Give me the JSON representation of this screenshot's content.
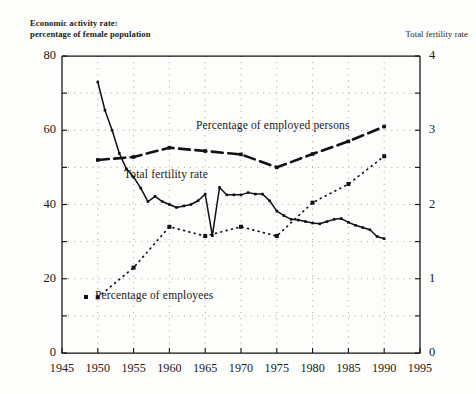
{
  "header": {
    "clipped_top_text": "",
    "left_axis_caption_line1": "Economic activity rate:",
    "left_axis_caption_line2": "percentage of female population",
    "right_axis_caption": "Total fertility rate"
  },
  "annotations": {
    "employed_persons": "Percentage of employed persons",
    "total_fertility_rate": "Total fertility rate",
    "employees": "Percentage of employees"
  },
  "colors": {
    "ink": "#111111",
    "grid": "#8a8a86",
    "paper": "#fdfdfb"
  },
  "chart_data": {
    "type": "line",
    "title": "",
    "xlabel": "",
    "ylabel": "Economic activity rate: percentage of female population",
    "y2label": "Total fertility rate",
    "xlim": [
      1945,
      1995
    ],
    "ylim": [
      0,
      80
    ],
    "y2lim": [
      0,
      4
    ],
    "grid": true,
    "legend": "inline-annotations",
    "xticks": [
      1945,
      1950,
      1955,
      1960,
      1965,
      1970,
      1975,
      1980,
      1985,
      1990,
      1995
    ],
    "xticklabels": [
      "1945",
      "1950",
      "1955",
      "1960",
      "1965",
      "1970",
      "1975",
      "1980",
      "1985",
      "1990",
      "1995"
    ],
    "yticks": [
      0,
      10,
      20,
      30,
      40,
      50,
      60,
      70,
      80
    ],
    "yticklabels": [
      "0",
      "",
      "20",
      "",
      "40",
      "",
      "60",
      "",
      "80"
    ],
    "y2ticks": [
      0,
      0.5,
      1,
      1.5,
      2,
      2.5,
      3,
      3.5,
      4
    ],
    "y2ticklabels": [
      "0",
      "",
      "1",
      "",
      "2",
      "",
      "3",
      "",
      "4"
    ],
    "series": [
      {
        "name": "Total fertility rate",
        "axis": "right",
        "style": "solid-line-with-square-markers",
        "x": [
          1950,
          1951,
          1952,
          1953,
          1954,
          1955,
          1956,
          1957,
          1958,
          1959,
          1960,
          1961,
          1962,
          1963,
          1964,
          1965,
          1966,
          1967,
          1968,
          1969,
          1970,
          1971,
          1972,
          1973,
          1974,
          1975,
          1976,
          1977,
          1978,
          1979,
          1980,
          1981,
          1982,
          1983,
          1984,
          1985,
          1986,
          1987,
          1988,
          1989,
          1990
        ],
        "values_right_axis": [
          3.65,
          3.27,
          3.0,
          2.69,
          2.48,
          2.37,
          2.22,
          2.04,
          2.11,
          2.04,
          2.0,
          1.96,
          1.98,
          2.0,
          2.05,
          2.14,
          1.58,
          2.23,
          2.13,
          2.13,
          2.13,
          2.16,
          2.14,
          2.14,
          2.05,
          1.91,
          1.85,
          1.8,
          1.79,
          1.77,
          1.75,
          1.74,
          1.77,
          1.8,
          1.81,
          1.76,
          1.72,
          1.69,
          1.66,
          1.57,
          1.54
        ],
        "values_left_axis_equivalent": [
          73.0,
          65.4,
          60.0,
          53.8,
          49.6,
          47.4,
          44.4,
          40.8,
          42.2,
          40.8,
          40.0,
          39.2,
          39.6,
          40.0,
          41.0,
          42.8,
          31.6,
          44.6,
          42.6,
          42.6,
          42.6,
          43.2,
          42.8,
          42.8,
          41.0,
          38.2,
          37.0,
          36.0,
          35.8,
          35.4,
          35.0,
          34.8,
          35.4,
          36.0,
          36.2,
          35.2,
          34.4,
          33.8,
          33.2,
          31.4,
          30.8
        ]
      },
      {
        "name": "Percentage of employed persons",
        "axis": "left",
        "style": "dashed-line-with-square-markers",
        "x": [
          1950,
          1955,
          1960,
          1965,
          1970,
          1975,
          1980,
          1985,
          1990
        ],
        "values": [
          52.0,
          52.8,
          55.3,
          54.4,
          53.5,
          50.0,
          53.6,
          57.0,
          61.0
        ]
      },
      {
        "name": "Percentage of employees",
        "axis": "left",
        "style": "dotted-with-square-markers",
        "x": [
          1950,
          1955,
          1960,
          1965,
          1970,
          1975,
          1980,
          1985,
          1990
        ],
        "values": [
          15.0,
          23.0,
          34.0,
          31.5,
          34.0,
          31.5,
          40.5,
          45.5,
          53.0
        ]
      }
    ]
  }
}
